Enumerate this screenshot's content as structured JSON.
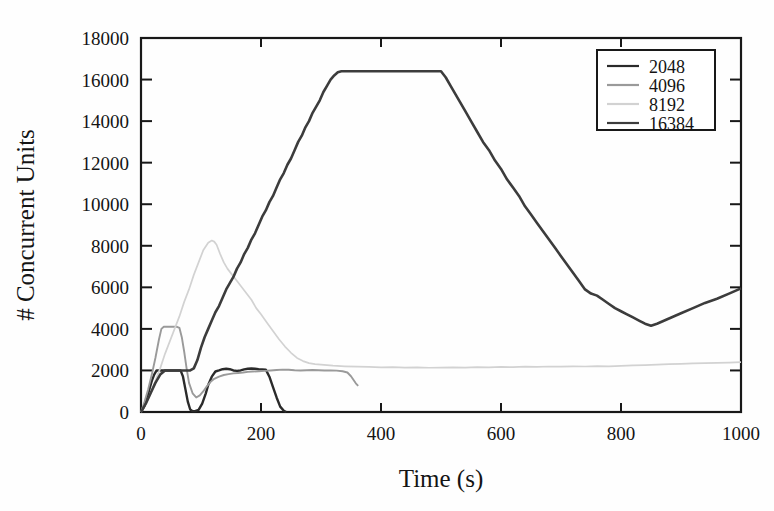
{
  "chart_data": {
    "type": "line",
    "title": "",
    "xlabel": "Time (s)",
    "ylabel": "# Concurrent Units",
    "xlim": [
      0,
      1000
    ],
    "ylim": [
      0,
      18000
    ],
    "xticks": [
      0,
      200,
      400,
      600,
      800,
      1000
    ],
    "yticks": [
      0,
      2000,
      4000,
      6000,
      8000,
      10000,
      12000,
      14000,
      16000,
      18000
    ],
    "xtick_labels": [
      "0",
      "200",
      "400",
      "600",
      "800",
      "1000"
    ],
    "ytick_labels": [
      "0",
      "2000",
      "4000",
      "6000",
      "8000",
      "10000",
      "12000",
      "14000",
      "16000",
      "18000"
    ],
    "grid": false,
    "legend_position": "upper right",
    "legend_entries": [
      "2048",
      "4096",
      "8192",
      "16384"
    ],
    "series": [
      {
        "name": "2048",
        "color": "#2a2a2a",
        "width": 2.4,
        "x": [
          0,
          6,
          10,
          14,
          18,
          22,
          26,
          30,
          34,
          38,
          44,
          50,
          56,
          62,
          66,
          70,
          74,
          78,
          82,
          86,
          90,
          96,
          102,
          108,
          112,
          118,
          124,
          130,
          136,
          142,
          148,
          154,
          160,
          166,
          172,
          178,
          184,
          190,
          196,
          202,
          208,
          214,
          220,
          226,
          232,
          238,
          242
        ],
        "y": [
          0,
          300,
          700,
          1100,
          1500,
          1800,
          2000,
          2000,
          2000,
          2000,
          2000,
          2000,
          2000,
          2000,
          2000,
          1700,
          1100,
          500,
          120,
          40,
          40,
          100,
          400,
          900,
          1300,
          1700,
          1950,
          2000,
          2060,
          2080,
          2060,
          2000,
          1980,
          2000,
          2050,
          2080,
          2090,
          2080,
          2060,
          2050,
          2040,
          1700,
          1200,
          700,
          260,
          60,
          0
        ]
      },
      {
        "name": "4096",
        "color": "#9a9a9a",
        "width": 1.9,
        "x": [
          0,
          6,
          12,
          18,
          24,
          30,
          34,
          38,
          42,
          48,
          54,
          60,
          64,
          68,
          72,
          76,
          80,
          86,
          92,
          98,
          104,
          110,
          116,
          122,
          130,
          138,
          146,
          154,
          162,
          170,
          178,
          186,
          196,
          206,
          216,
          226,
          236,
          246,
          256,
          266,
          276,
          286,
          296,
          306,
          316,
          326,
          336,
          344,
          350,
          354,
          358,
          362
        ],
        "y": [
          0,
          500,
          1100,
          1800,
          2600,
          3500,
          4000,
          4100,
          4100,
          4100,
          4100,
          4100,
          4050,
          3600,
          2900,
          2100,
          1400,
          900,
          700,
          800,
          1000,
          1250,
          1450,
          1600,
          1700,
          1780,
          1820,
          1860,
          1880,
          1900,
          1930,
          1950,
          1960,
          1980,
          2000,
          2020,
          2040,
          2030,
          2010,
          2000,
          2010,
          2020,
          2010,
          2000,
          2000,
          1990,
          1960,
          1900,
          1720,
          1550,
          1380,
          1260
        ]
      },
      {
        "name": "8192",
        "color": "#d2d2d2",
        "width": 1.7,
        "x": [
          0,
          8,
          16,
          24,
          32,
          40,
          48,
          56,
          64,
          72,
          80,
          88,
          96,
          104,
          112,
          118,
          122,
          126,
          132,
          138,
          144,
          152,
          160,
          168,
          176,
          184,
          192,
          200,
          210,
          220,
          230,
          240,
          250,
          260,
          270,
          280,
          290,
          300,
          320,
          340,
          360,
          380,
          400,
          420,
          440,
          460,
          480,
          500,
          520,
          540,
          560,
          580,
          600,
          620,
          640,
          660,
          680,
          700,
          720,
          740,
          760,
          780,
          800,
          820,
          840,
          860,
          880,
          900,
          920,
          940,
          960,
          980,
          1000
        ],
        "y": [
          0,
          400,
          900,
          1500,
          2100,
          2800,
          3400,
          4000,
          4600,
          5300,
          5900,
          6600,
          7200,
          7800,
          8150,
          8250,
          8200,
          8050,
          7600,
          7200,
          6900,
          6600,
          6300,
          6000,
          5700,
          5400,
          5000,
          4700,
          4300,
          3900,
          3500,
          3150,
          2850,
          2600,
          2450,
          2350,
          2300,
          2280,
          2230,
          2200,
          2180,
          2170,
          2150,
          2160,
          2140,
          2150,
          2130,
          2140,
          2150,
          2140,
          2160,
          2150,
          2170,
          2160,
          2180,
          2170,
          2190,
          2180,
          2200,
          2190,
          2210,
          2200,
          2220,
          2240,
          2260,
          2280,
          2300,
          2320,
          2340,
          2350,
          2360,
          2380,
          2400
        ]
      },
      {
        "name": "16384",
        "color": "#3c3c3c",
        "width": 2.6,
        "x": [
          0,
          8,
          16,
          24,
          32,
          40,
          46,
          52,
          58,
          64,
          70,
          76,
          82,
          88,
          94,
          100,
          106,
          112,
          118,
          124,
          130,
          136,
          142,
          148,
          154,
          160,
          166,
          172,
          178,
          184,
          190,
          196,
          202,
          208,
          214,
          220,
          226,
          232,
          238,
          244,
          250,
          256,
          262,
          268,
          274,
          280,
          286,
          292,
          298,
          304,
          310,
          316,
          322,
          328,
          334,
          340,
          360,
          380,
          400,
          420,
          440,
          460,
          480,
          500,
          508,
          516,
          524,
          532,
          540,
          550,
          560,
          570,
          580,
          590,
          600,
          610,
          620,
          630,
          640,
          650,
          660,
          670,
          680,
          690,
          700,
          710,
          720,
          730,
          740,
          750,
          760,
          770,
          780,
          790,
          800,
          810,
          820,
          830,
          840,
          850,
          860,
          880,
          900,
          920,
          940,
          960,
          980,
          1000
        ],
        "y": [
          0,
          400,
          900,
          1400,
          1800,
          2000,
          2000,
          2000,
          2000,
          2000,
          2000,
          2000,
          2000,
          2100,
          2500,
          3100,
          3600,
          4000,
          4400,
          4800,
          5100,
          5500,
          5900,
          6200,
          6500,
          6900,
          7200,
          7600,
          7900,
          8300,
          8600,
          9000,
          9400,
          9700,
          10100,
          10400,
          10800,
          11200,
          11500,
          11900,
          12200,
          12600,
          13000,
          13300,
          13700,
          14000,
          14400,
          14700,
          15000,
          15400,
          15700,
          16000,
          16200,
          16350,
          16400,
          16400,
          16400,
          16400,
          16400,
          16400,
          16400,
          16400,
          16400,
          16400,
          16100,
          15700,
          15300,
          14900,
          14500,
          14000,
          13500,
          13000,
          12600,
          12100,
          11700,
          11200,
          10800,
          10400,
          9900,
          9500,
          9100,
          8700,
          8300,
          7900,
          7500,
          7100,
          6700,
          6300,
          5900,
          5700,
          5600,
          5400,
          5200,
          5000,
          4850,
          4700,
          4550,
          4400,
          4250,
          4150,
          4250,
          4500,
          4750,
          5000,
          5250,
          5450,
          5700,
          5950
        ]
      }
    ]
  }
}
